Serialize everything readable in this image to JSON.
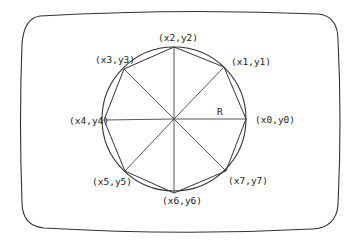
{
  "diagram": {
    "radius_label": "R",
    "vertices": [
      {
        "label": "(x0,y0)",
        "x": 246,
        "y": 119,
        "lx": 255,
        "ly": 123
      },
      {
        "label": "(x1,y1)",
        "x": 224,
        "y": 67,
        "lx": 231,
        "ly": 65
      },
      {
        "label": "(x2,y2)",
        "x": 174,
        "y": 47,
        "lx": 158,
        "ly": 41
      },
      {
        "label": "(x3,y3)",
        "x": 124,
        "y": 69,
        "lx": 95,
        "ly": 63
      },
      {
        "label": "(x4,y4)",
        "x": 104,
        "y": 120,
        "lx": 69,
        "ly": 124
      },
      {
        "label": "(x5,y5)",
        "x": 125,
        "y": 171,
        "lx": 92,
        "ly": 185
      },
      {
        "label": "(x6,y6)",
        "x": 174,
        "y": 193,
        "lx": 162,
        "ly": 204
      },
      {
        "label": "(x7,y7)",
        "x": 226,
        "y": 171,
        "lx": 228,
        "ly": 184
      }
    ],
    "center": {
      "x": 174,
      "y": 119
    },
    "circle_radius": 72,
    "colors": {
      "stroke": "#333333",
      "background": "#ffffff"
    }
  }
}
